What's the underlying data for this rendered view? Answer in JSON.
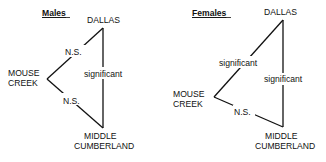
{
  "panels": [
    {
      "title": "Males",
      "nodes": {
        "dallas": [
          "DALLAS"
        ],
        "mouse_creek": [
          "MOUSE",
          "CREEK"
        ],
        "middle_cumberland": [
          "MIDDLE",
          "CUMBERLAND"
        ]
      },
      "edges": [
        {
          "from": "Dallas",
          "to": "Mouse Creek",
          "label": "N.S."
        },
        {
          "from": "Mouse Creek",
          "to": "Middle Cumberland",
          "label": "N.S."
        },
        {
          "from": "Dallas",
          "to": "Middle Cumberland",
          "label": "significant"
        }
      ]
    },
    {
      "title": "Females",
      "nodes": {
        "dallas": [
          "DALLAS"
        ],
        "mouse_creek": [
          "MOUSE",
          "CREEK"
        ],
        "middle_cumberland": [
          "MIDDLE",
          "CUMBERLAND"
        ]
      },
      "edges": [
        {
          "from": "Dallas",
          "to": "Mouse Creek",
          "label": "significant"
        },
        {
          "from": "Mouse Creek",
          "to": "Middle Cumberland",
          "label": "N.S."
        },
        {
          "from": "Dallas",
          "to": "Middle Cumberland",
          "label": "significant"
        }
      ]
    }
  ]
}
